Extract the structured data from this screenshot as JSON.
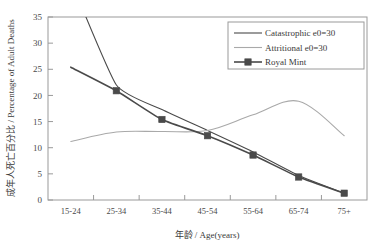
{
  "chart_data": {
    "type": "line",
    "title": "",
    "xlabel": "年龄 / Age(years)",
    "ylabel": "成年人死亡百分比 / Percentage of Adult Deaths",
    "categories": [
      "15-24",
      "25-34",
      "35-44",
      "45-54",
      "55-64",
      "65-74",
      "75+"
    ],
    "ylim": [
      0,
      35
    ],
    "yticks": [
      0,
      5,
      10,
      15,
      20,
      25,
      30,
      35
    ],
    "ytick_labels": [
      "0",
      "5",
      "10",
      "15",
      "20",
      "25",
      "30",
      "35"
    ],
    "grid": false,
    "legend_position": "top-right",
    "series": [
      {
        "name": "Catastrophic e0=30",
        "color": "#4a4a4a",
        "style": "line",
        "marker": "none",
        "width": 1.1,
        "values": [
          42.0,
          22.0,
          17.3,
          13.3,
          9.2,
          4.7,
          1.3
        ],
        "note": "first point rises off the top of the axis"
      },
      {
        "name": "Attritional e0=30",
        "color": "#a9a9a9",
        "style": "line",
        "marker": "none",
        "width": 1.1,
        "values": [
          11.2,
          13.0,
          13.1,
          13.3,
          16.3,
          18.9,
          12.3
        ]
      },
      {
        "name": "Royal Mint",
        "color": "#4a4a4a",
        "style": "line-marker",
        "marker": "square",
        "width": 1.6,
        "values": [
          25.4,
          20.9,
          15.4,
          12.3,
          8.6,
          4.4,
          1.3
        ],
        "note": "no marker drawn at the first category"
      }
    ]
  },
  "legend": {
    "entries": [
      {
        "label": "Catastrophic e0=30"
      },
      {
        "label": "Attritional e0=30"
      },
      {
        "label": "Royal Mint"
      }
    ]
  },
  "axes": {
    "y_title": "成年人死亡百分比 / Percentage of Adult Deaths",
    "x_title": "年龄 / Age(years)"
  }
}
